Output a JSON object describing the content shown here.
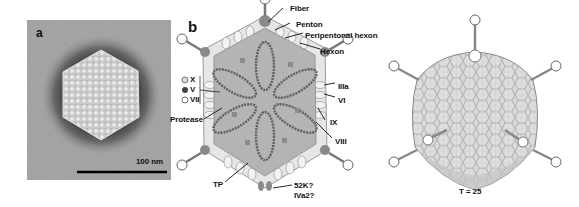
{
  "figure": {
    "panels": [
      {
        "id": "a",
        "letter": "a",
        "type": "electron-micrograph",
        "subject": "adenovirus particle, negative stain",
        "scale_bar_label": "100 nm"
      },
      {
        "id": "b",
        "letter": "b",
        "type": "schematic-cross-section",
        "labels_right": [
          "Fiber",
          "Penton",
          "Peripentonal hexon",
          "Hexon",
          "IIIa",
          "VI",
          "IX",
          "VIII"
        ],
        "labels_left": [
          "Protease",
          "TP"
        ],
        "labels_bottom": [
          "52K?",
          "IVa2?"
        ],
        "legend": [
          {
            "marker": "open-circle-gray",
            "label": "X"
          },
          {
            "marker": "filled-circle-dark",
            "label": "V"
          },
          {
            "marker": "open-circle",
            "label": "VII"
          }
        ]
      },
      {
        "id": "c",
        "type": "icosahedral-capsid-rendering",
        "caption": "T = 25"
      }
    ]
  },
  "labels": {
    "a": "a",
    "b": "b",
    "scale": "100 nm",
    "fiber": "Fiber",
    "penton": "Penton",
    "peripentonal": "Peripentonal hexon",
    "hexon": "Hexon",
    "iiia": "IIIa",
    "vi": "VI",
    "ix": "IX",
    "viii": "VIII",
    "protease": "Protease",
    "tp": "TP",
    "k52": "52K?",
    "iva2": "IVa2?",
    "x": "X",
    "v": "V",
    "vii": "VII",
    "tnum": "T = 25"
  },
  "colors": {
    "core_fill": "#b4b4b4",
    "shell": "#d8d8d8",
    "dna": "#6a6a6a",
    "penton": "#8a8a8a",
    "capsid_face": "#d6d6d6",
    "capsid_line": "#8f8f8f"
  }
}
